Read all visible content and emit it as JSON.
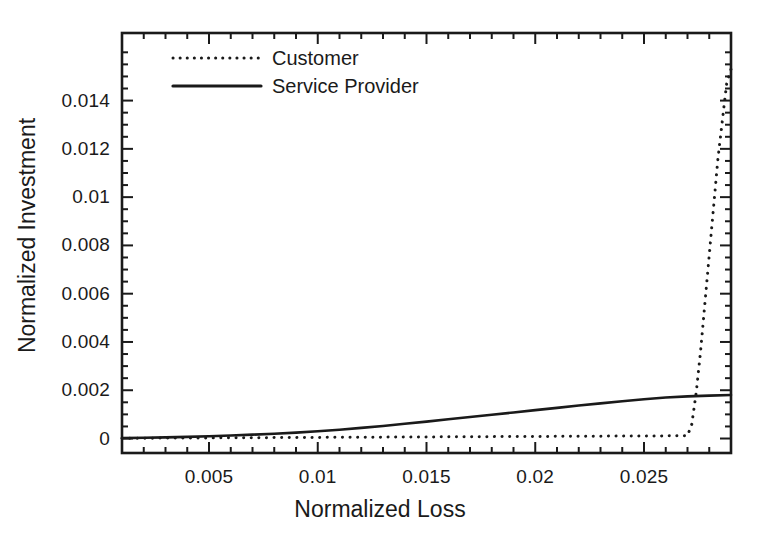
{
  "chart_data": {
    "type": "line",
    "title": "",
    "xlabel": "Normalized Loss",
    "ylabel": "Normalized Investment",
    "xlim": [
      0.001,
      0.029
    ],
    "ylim": [
      -0.0006,
      0.0168
    ],
    "grid": false,
    "legend_position": "top-left-inside",
    "xticks": [
      "0.005",
      "0.01",
      "0.015",
      "0.02",
      "0.025"
    ],
    "xtick_values": [
      0.005,
      0.01,
      0.015,
      0.02,
      0.025
    ],
    "yticks": [
      "0",
      "0.002",
      "0.004",
      "0.006",
      "0.008",
      "0.01",
      "0.012",
      "0.014"
    ],
    "ytick_values": [
      0,
      0.002,
      0.004,
      0.006,
      0.008,
      0.01,
      0.012,
      0.014
    ],
    "x_minor_step": 0.001,
    "y_minor_step": 0.0005,
    "series": [
      {
        "name": "Customer",
        "style": "dotted",
        "color": "#1a1a1a",
        "x": [
          0.001,
          0.002,
          0.003,
          0.004,
          0.005,
          0.006,
          0.007,
          0.008,
          0.009,
          0.01,
          0.011,
          0.012,
          0.013,
          0.014,
          0.015,
          0.016,
          0.017,
          0.018,
          0.019,
          0.02,
          0.021,
          0.022,
          0.023,
          0.024,
          0.025,
          0.026,
          0.0265,
          0.027,
          0.0272,
          0.0274,
          0.0276,
          0.028,
          0.0284,
          0.0288,
          0.029
        ],
        "y": [
          1e-05,
          1.4e-05,
          1.8e-05,
          2.2e-05,
          2.6e-05,
          3e-05,
          3.4e-05,
          3.8e-05,
          4.2e-05,
          4.6e-05,
          5e-05,
          5.4e-05,
          5.8e-05,
          6.2e-05,
          6.6e-05,
          7e-05,
          7.4e-05,
          7.8e-05,
          8.2e-05,
          8.6e-05,
          9e-05,
          9.4e-05,
          9.8e-05,
          0.000102,
          0.000106,
          0.00011,
          0.000112,
          0.000116,
          0.0006,
          0.0019,
          0.0036,
          0.0076,
          0.0116,
          0.0147,
          0.0153
        ]
      },
      {
        "name": "Service Provider",
        "style": "solid",
        "color": "#1a1a1a",
        "x": [
          0.001,
          0.002,
          0.003,
          0.004,
          0.005,
          0.006,
          0.007,
          0.008,
          0.009,
          0.01,
          0.011,
          0.012,
          0.013,
          0.014,
          0.015,
          0.016,
          0.017,
          0.018,
          0.019,
          0.02,
          0.021,
          0.022,
          0.023,
          0.024,
          0.025,
          0.026,
          0.027,
          0.028,
          0.029
        ],
        "y": [
          1.5e-05,
          3e-05,
          4.8e-05,
          7e-05,
          9.5e-05,
          0.000125,
          0.00016,
          0.0002,
          0.000245,
          0.0003,
          0.000365,
          0.00044,
          0.00052,
          0.00061,
          0.0007,
          0.000795,
          0.00089,
          0.000985,
          0.00108,
          0.001175,
          0.00127,
          0.001365,
          0.001455,
          0.001545,
          0.00163,
          0.0017,
          0.001745,
          0.001775,
          0.0018
        ]
      }
    ]
  },
  "legend": {
    "items": [
      {
        "label": "Customer",
        "style": "dotted"
      },
      {
        "label": "Service Provider",
        "style": "solid"
      }
    ]
  },
  "axes": {
    "x_title": "Normalized Loss",
    "y_title": "Normalized Investment"
  },
  "colors": {
    "line": "#1a1a1a",
    "frame": "#1a1a1a",
    "background": "#ffffff"
  }
}
